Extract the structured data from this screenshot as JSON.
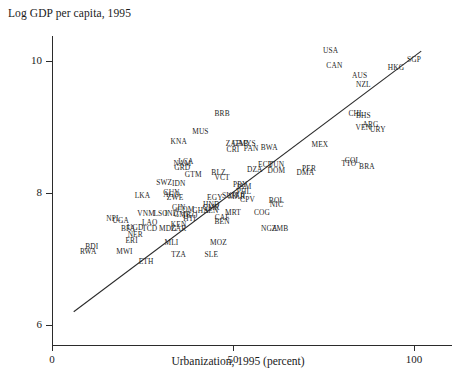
{
  "chart_data": {
    "type": "scatter",
    "title": "Log GDP per capita, 1995",
    "xlabel": "Urbanization, 1995 (percent)",
    "ylabel": "",
    "xlim": [
      0,
      110
    ],
    "ylim": [
      5.8,
      10.5
    ],
    "xticks": [
      0,
      50,
      100
    ],
    "yticks": [
      6,
      8,
      10
    ],
    "grid": false,
    "legend": null,
    "point_marker": "text-label",
    "trendline": {
      "label": "fit-line",
      "x": [
        6,
        102
      ],
      "y": [
        6.2,
        10.15
      ]
    },
    "points": [
      {
        "code": "USA",
        "x": 77,
        "y": 10.15
      },
      {
        "code": "CAN",
        "x": 78,
        "y": 9.92
      },
      {
        "code": "AUS",
        "x": 85,
        "y": 9.78
      },
      {
        "code": "NZL",
        "x": 86,
        "y": 9.64
      },
      {
        "code": "HKG",
        "x": 95,
        "y": 9.9
      },
      {
        "code": "SGP",
        "x": 100,
        "y": 10.02
      },
      {
        "code": "BRB",
        "x": 47,
        "y": 9.2
      },
      {
        "code": "MUS",
        "x": 41,
        "y": 8.92
      },
      {
        "code": "KNA",
        "x": 35,
        "y": 8.77
      },
      {
        "code": "MEX",
        "x": 74,
        "y": 8.72
      },
      {
        "code": "ZAF",
        "x": 50,
        "y": 8.74
      },
      {
        "code": "GAB",
        "x": 52,
        "y": 8.74
      },
      {
        "code": "MYS",
        "x": 54,
        "y": 8.74
      },
      {
        "code": "CRI",
        "x": 50,
        "y": 8.65
      },
      {
        "code": "PAN",
        "x": 55,
        "y": 8.67
      },
      {
        "code": "BWA",
        "x": 60,
        "y": 8.68
      },
      {
        "code": "COL",
        "x": 83,
        "y": 8.48
      },
      {
        "code": "TTO",
        "x": 82,
        "y": 8.44
      },
      {
        "code": "BRA",
        "x": 87,
        "y": 8.4
      },
      {
        "code": "CHL",
        "x": 84,
        "y": 9.2
      },
      {
        "code": "BHS",
        "x": 86,
        "y": 9.17
      },
      {
        "code": "ARG",
        "x": 88,
        "y": 9.03
      },
      {
        "code": "VEN",
        "x": 86,
        "y": 8.98
      },
      {
        "code": "URY",
        "x": 90,
        "y": 8.95
      },
      {
        "code": "LCA",
        "x": 37,
        "y": 8.47
      },
      {
        "code": "NAM",
        "x": 36,
        "y": 8.44
      },
      {
        "code": "GRD",
        "x": 36,
        "y": 8.38
      },
      {
        "code": "GTM",
        "x": 39,
        "y": 8.28
      },
      {
        "code": "BLZ",
        "x": 46,
        "y": 8.3
      },
      {
        "code": "VCT",
        "x": 47,
        "y": 8.23
      },
      {
        "code": "ECU",
        "x": 59,
        "y": 8.42
      },
      {
        "code": "TUN",
        "x": 62,
        "y": 8.42
      },
      {
        "code": "DZA",
        "x": 56,
        "y": 8.35
      },
      {
        "code": "DOM",
        "x": 62,
        "y": 8.33
      },
      {
        "code": "PER",
        "x": 71,
        "y": 8.37
      },
      {
        "code": "DMA",
        "x": 70,
        "y": 8.31
      },
      {
        "code": "SWZ",
        "x": 31,
        "y": 8.15
      },
      {
        "code": "IDN",
        "x": 35,
        "y": 8.13
      },
      {
        "code": "GUY",
        "x": 33,
        "y": 8.0
      },
      {
        "code": "PRY",
        "x": 52,
        "y": 8.12
      },
      {
        "code": "JAM",
        "x": 53,
        "y": 8.09
      },
      {
        "code": "PHL",
        "x": 53,
        "y": 8.02
      },
      {
        "code": "EGY",
        "x": 45,
        "y": 7.93
      },
      {
        "code": "SUR",
        "x": 49,
        "y": 7.95
      },
      {
        "code": "MAR",
        "x": 51,
        "y": 7.94
      },
      {
        "code": "FJI",
        "x": 52,
        "y": 7.95
      },
      {
        "code": "CPV",
        "x": 54,
        "y": 7.9
      },
      {
        "code": "BOL",
        "x": 62,
        "y": 7.88
      },
      {
        "code": "LKA",
        "x": 25,
        "y": 7.96
      },
      {
        "code": "AGO",
        "x": 33,
        "y": 7.97
      },
      {
        "code": "ZWE",
        "x": 34,
        "y": 7.92
      },
      {
        "code": "HND",
        "x": 44,
        "y": 7.82
      },
      {
        "code": "NIC",
        "x": 62,
        "y": 7.82
      },
      {
        "code": "CMR",
        "x": 44,
        "y": 7.78
      },
      {
        "code": "SEN",
        "x": 44,
        "y": 7.72
      },
      {
        "code": "MRT",
        "x": 50,
        "y": 7.7
      },
      {
        "code": "COG",
        "x": 58,
        "y": 7.7
      },
      {
        "code": "GIN",
        "x": 35,
        "y": 7.78
      },
      {
        "code": "COM",
        "x": 37,
        "y": 7.74
      },
      {
        "code": "GHA",
        "x": 41,
        "y": 7.72
      },
      {
        "code": "VNM",
        "x": 26,
        "y": 7.68
      },
      {
        "code": "LSO",
        "x": 30,
        "y": 7.68
      },
      {
        "code": "IND",
        "x": 33,
        "y": 7.68
      },
      {
        "code": "GMB",
        "x": 36,
        "y": 7.67
      },
      {
        "code": "TGO",
        "x": 38,
        "y": 7.65
      },
      {
        "code": "HTI",
        "x": 38,
        "y": 7.6
      },
      {
        "code": "CAF",
        "x": 47,
        "y": 7.62
      },
      {
        "code": "BEN",
        "x": 47,
        "y": 7.56
      },
      {
        "code": "LAO",
        "x": 27,
        "y": 7.54
      },
      {
        "code": "KEN",
        "x": 35,
        "y": 7.52
      },
      {
        "code": "NPL",
        "x": 17,
        "y": 7.6
      },
      {
        "code": "UGA",
        "x": 19,
        "y": 7.58
      },
      {
        "code": "BFA",
        "x": 21,
        "y": 7.46
      },
      {
        "code": "UGD",
        "x": 23,
        "y": 7.47
      },
      {
        "code": "TCD",
        "x": 27,
        "y": 7.45
      },
      {
        "code": "MDG",
        "x": 32,
        "y": 7.45
      },
      {
        "code": "ZAR",
        "x": 35,
        "y": 7.46
      },
      {
        "code": "NGA",
        "x": 60,
        "y": 7.45
      },
      {
        "code": "ZMB",
        "x": 63,
        "y": 7.45
      },
      {
        "code": "NER",
        "x": 23,
        "y": 7.37
      },
      {
        "code": "ERI",
        "x": 22,
        "y": 7.28
      },
      {
        "code": "MLI",
        "x": 33,
        "y": 7.25
      },
      {
        "code": "MOZ",
        "x": 46,
        "y": 7.25
      },
      {
        "code": "BDI",
        "x": 11,
        "y": 7.18
      },
      {
        "code": "RWA",
        "x": 10,
        "y": 7.1
      },
      {
        "code": "MWI",
        "x": 20,
        "y": 7.1
      },
      {
        "code": "TZA",
        "x": 35,
        "y": 7.06
      },
      {
        "code": "SLE",
        "x": 44,
        "y": 7.06
      },
      {
        "code": "ETH",
        "x": 26,
        "y": 6.95
      }
    ]
  }
}
